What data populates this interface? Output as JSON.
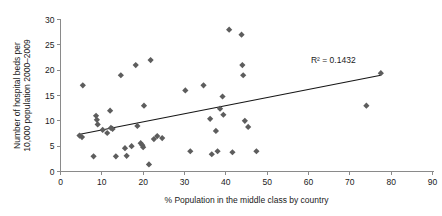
{
  "chart_data": {
    "type": "scatter",
    "title": "",
    "xlabel": "% Population in the middle class by country",
    "ylabel": "Number of hospital beds per 10,000 population 2000–2009",
    "ylabel_line1": "Number of hospital beds per",
    "ylabel_line2": "10,000 population 2000–2009",
    "xlim": [
      0,
      90
    ],
    "ylim": [
      0,
      30
    ],
    "xticks": [
      0,
      10,
      20,
      30,
      40,
      50,
      60,
      70,
      80,
      90
    ],
    "yticks": [
      0,
      5,
      10,
      15,
      20,
      25,
      30
    ],
    "grid": false,
    "legend": "none",
    "marker_shape": "diamond",
    "marker_color": "#5d5d5d",
    "annotations": [
      {
        "name": "r-squared",
        "text": "R² = 0.1432",
        "x": 66,
        "y": 21.5
      }
    ],
    "trendline": {
      "name": "linear-trendline",
      "color": "#161616",
      "x_start": 4.4,
      "y_start": 7.3,
      "x_end": 77.5,
      "y_end": 19.0
    },
    "points": [
      {
        "x": 4.6,
        "y": 7.1
      },
      {
        "x": 5.2,
        "y": 6.8
      },
      {
        "x": 5.4,
        "y": 17.0
      },
      {
        "x": 8.0,
        "y": 3.0
      },
      {
        "x": 8.6,
        "y": 11.0
      },
      {
        "x": 8.8,
        "y": 10.2
      },
      {
        "x": 9.0,
        "y": 9.3
      },
      {
        "x": 10.2,
        "y": 8.2
      },
      {
        "x": 11.3,
        "y": 7.6
      },
      {
        "x": 12.0,
        "y": 12.0
      },
      {
        "x": 12.2,
        "y": 8.6
      },
      {
        "x": 12.6,
        "y": 8.4
      },
      {
        "x": 13.4,
        "y": 3.0
      },
      {
        "x": 14.6,
        "y": 19.0
      },
      {
        "x": 15.6,
        "y": 4.6
      },
      {
        "x": 16.0,
        "y": 3.1
      },
      {
        "x": 17.2,
        "y": 5.0
      },
      {
        "x": 18.2,
        "y": 21.0
      },
      {
        "x": 18.6,
        "y": 9.0
      },
      {
        "x": 19.4,
        "y": 5.6
      },
      {
        "x": 19.8,
        "y": 5.2
      },
      {
        "x": 20.0,
        "y": 4.8
      },
      {
        "x": 20.2,
        "y": 13.0
      },
      {
        "x": 21.4,
        "y": 1.4
      },
      {
        "x": 21.8,
        "y": 22.0
      },
      {
        "x": 22.6,
        "y": 6.4
      },
      {
        "x": 23.4,
        "y": 7.0
      },
      {
        "x": 24.6,
        "y": 6.6
      },
      {
        "x": 30.2,
        "y": 16.0
      },
      {
        "x": 31.4,
        "y": 4.0
      },
      {
        "x": 34.6,
        "y": 17.0
      },
      {
        "x": 36.2,
        "y": 10.4
      },
      {
        "x": 36.6,
        "y": 3.4
      },
      {
        "x": 37.6,
        "y": 8.0
      },
      {
        "x": 38.0,
        "y": 4.0
      },
      {
        "x": 38.6,
        "y": 12.4
      },
      {
        "x": 39.2,
        "y": 14.8
      },
      {
        "x": 39.4,
        "y": 11.2
      },
      {
        "x": 40.8,
        "y": 28.0
      },
      {
        "x": 41.6,
        "y": 3.8
      },
      {
        "x": 43.8,
        "y": 27.0
      },
      {
        "x": 44.0,
        "y": 21.0
      },
      {
        "x": 44.2,
        "y": 19.0
      },
      {
        "x": 44.6,
        "y": 10.0
      },
      {
        "x": 45.4,
        "y": 8.8
      },
      {
        "x": 47.4,
        "y": 4.0
      },
      {
        "x": 74.0,
        "y": 13.0
      },
      {
        "x": 77.5,
        "y": 19.4
      }
    ]
  }
}
